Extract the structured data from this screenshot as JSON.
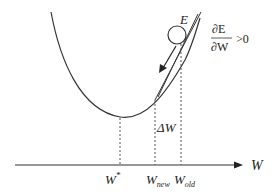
{
  "diagram": {
    "type": "gradient-descent-illustration",
    "axis": {
      "label": "W"
    },
    "curve": {
      "description": "convex error curve E(W)"
    },
    "ball_label": "E",
    "derivative": {
      "numerator": "∂E",
      "denominator": "∂W",
      "relation": ">0"
    },
    "delta_label": "ΔW",
    "delta_symbol": "Δ",
    "delta_var": "W",
    "ticks": [
      {
        "id": "w-star",
        "base": "W",
        "sup": "*"
      },
      {
        "id": "w-new",
        "base": "W",
        "sub": "new"
      },
      {
        "id": "w-old",
        "base": "W",
        "sub": "old"
      }
    ],
    "colors": {
      "line": "#333333",
      "dashed": "#555555",
      "background": "#ffffff"
    }
  }
}
